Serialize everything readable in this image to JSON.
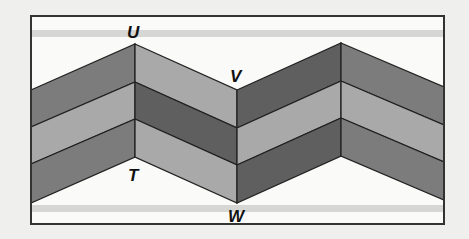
{
  "figure": {
    "labels": {
      "U": "U",
      "V": "V",
      "T": "T",
      "W": "W"
    },
    "points": {
      "U": [
        135,
        44
      ],
      "T": [
        135,
        157
      ],
      "V": [
        237,
        90
      ],
      "W": [
        237,
        203
      ]
    },
    "colors": {
      "background": "#efefed",
      "frame_fill": "#fafaf8",
      "stripe": "#d6d6d4",
      "dark": "#7c7c7c",
      "darkest": "#5f5f5f",
      "light": "#a9a9a9",
      "line": "#222222"
    }
  }
}
